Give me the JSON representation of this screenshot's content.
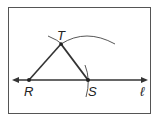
{
  "diagram": {
    "points": [
      {
        "name": "R",
        "x": 29,
        "y": 80
      },
      {
        "name": "S",
        "x": 88,
        "y": 80
      },
      {
        "name": "T",
        "x": 61,
        "y": 44
      }
    ],
    "line_label": "ℓ",
    "labels": {
      "R": "R",
      "S": "S",
      "T": "T"
    },
    "colors": {
      "stroke": "#333333",
      "frame": "#555555",
      "background": "#ffffff"
    }
  }
}
